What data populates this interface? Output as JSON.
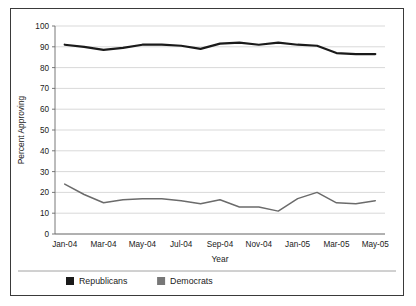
{
  "chart_data": {
    "type": "line",
    "title": "",
    "xlabel": "Year",
    "ylabel": "Percent Approving",
    "ylim": [
      0,
      100
    ],
    "ytick_step": 10,
    "yticks": [
      "0",
      "10",
      "20",
      "30",
      "40",
      "50",
      "60",
      "70",
      "80",
      "90",
      "100"
    ],
    "grid": true,
    "legend_position": "bottom-left",
    "x": [
      "Jan-04",
      "Feb-04",
      "Mar-04",
      "Apr-04",
      "May-04",
      "Jun-04",
      "Jul-04",
      "Aug-04",
      "Sep-04",
      "Oct-04",
      "Nov-04",
      "Dec-04",
      "Jan-05",
      "Feb-05",
      "Mar-05",
      "Apr-05",
      "May-05"
    ],
    "xticks": [
      "Jan-04",
      "Mar-04",
      "May-04",
      "Jul-04",
      "Sep-04",
      "Nov-04",
      "Jan-05",
      "Mar-05",
      "May-05"
    ],
    "xtick_indices": [
      0,
      2,
      4,
      6,
      8,
      10,
      12,
      14,
      16
    ],
    "series": [
      {
        "name": "Republicans",
        "color": "#1a1a1a",
        "width": 2.2,
        "values": [
          91,
          90,
          88.5,
          89.5,
          91,
          91,
          90.5,
          89,
          91.5,
          92,
          91,
          92,
          91,
          90.5,
          87,
          86.5,
          86.5
        ]
      },
      {
        "name": "Democrats",
        "color": "#6b6b6b",
        "width": 1.5,
        "values": [
          24,
          19,
          15,
          16.5,
          17,
          17,
          16,
          14.5,
          16.5,
          13,
          13,
          11,
          17,
          20,
          15,
          14.5,
          16
        ]
      }
    ]
  },
  "legend": {
    "items": [
      {
        "label": "Republicans",
        "swatch": "#1a1a1a"
      },
      {
        "label": "Democrats",
        "swatch": "#777777"
      }
    ]
  },
  "axis": {
    "y_title": "Percent Approving",
    "x_title": "Year"
  }
}
